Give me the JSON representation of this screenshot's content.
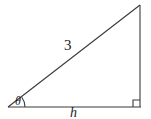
{
  "figure": {
    "type": "right-triangle-diagram",
    "background_color": "#ffffff",
    "stroke_color": "#3a3a3a",
    "labels": {
      "hypotenuse": "3",
      "base": "h",
      "angle": "θ"
    },
    "markers": {
      "right_angle": "right-angle-square",
      "angle_arc": "angle-arc"
    },
    "geometry": {
      "vertex_left": [
        8,
        107
      ],
      "vertex_right": [
        140,
        107
      ],
      "vertex_top": [
        140,
        5
      ]
    }
  }
}
